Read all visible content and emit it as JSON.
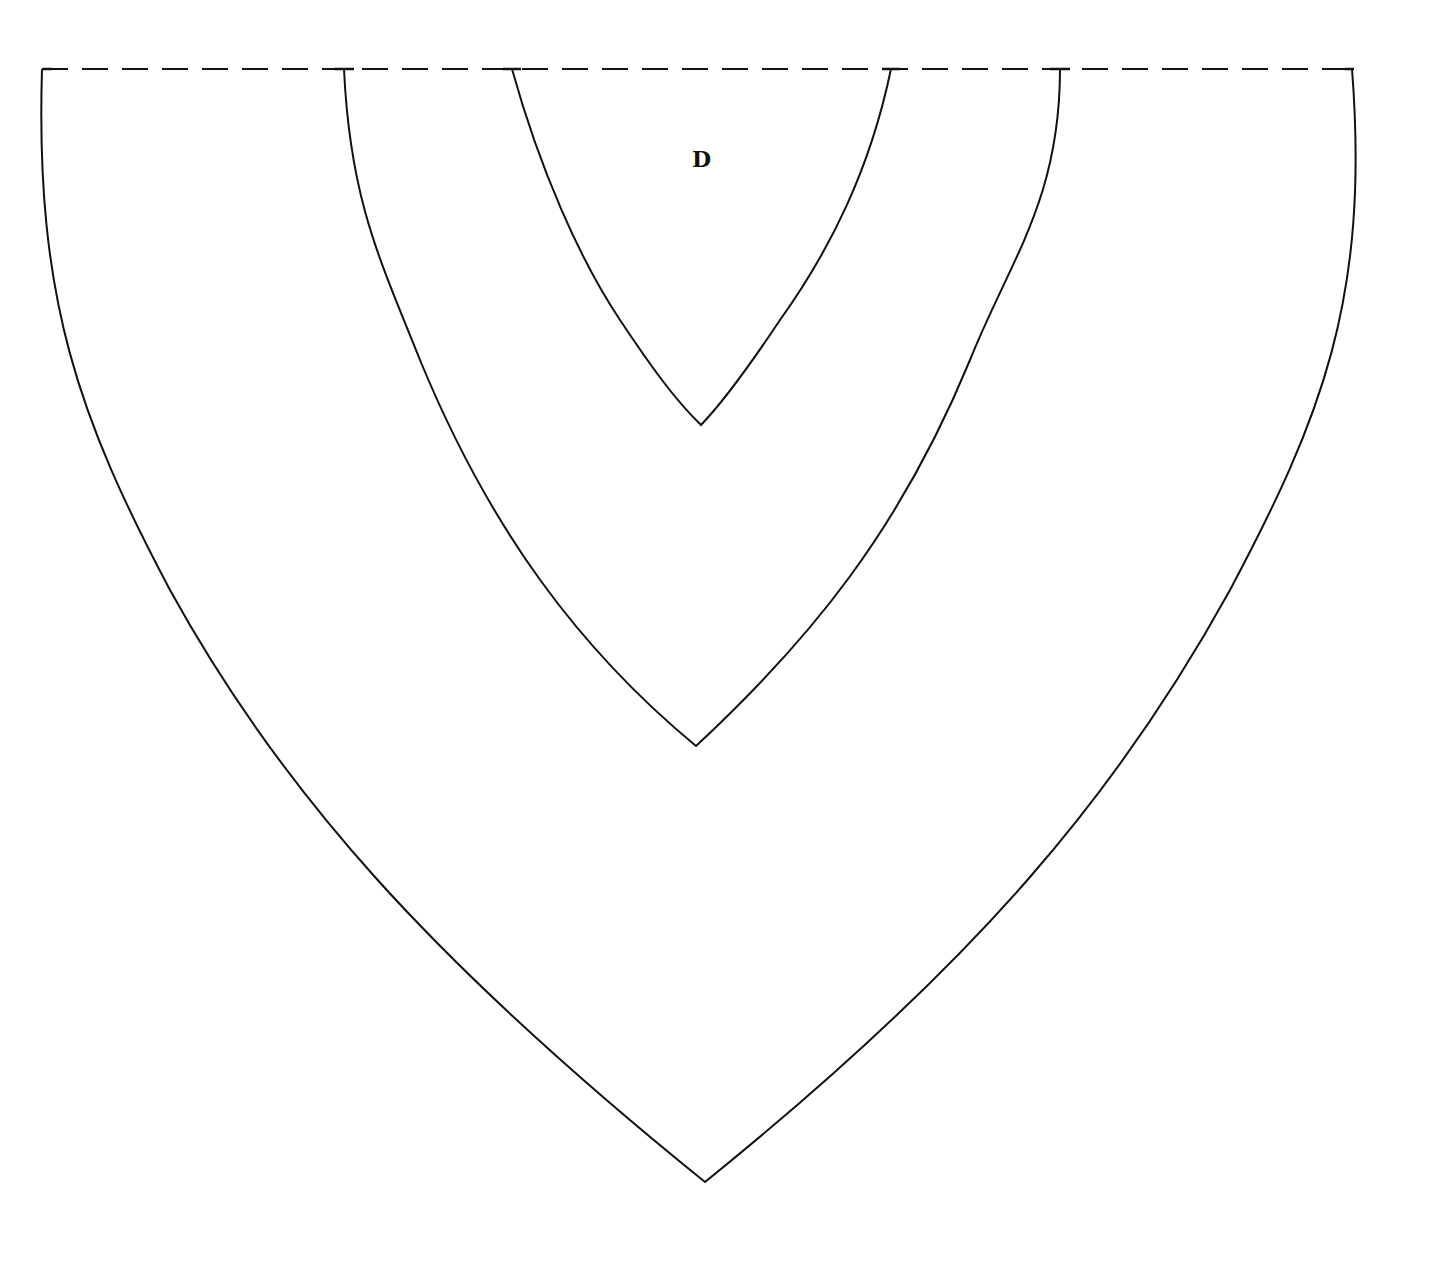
{
  "diagram": {
    "label": "D",
    "stroke_color": "#111111",
    "background": "#ffffff",
    "baseline": {
      "x1": 42,
      "x2": 1354,
      "y": 69,
      "style": "dashed"
    },
    "curves": [
      {
        "name": "outer",
        "left_x": 42,
        "right_x": 1352,
        "apex_x": 705,
        "apex_y": 1182
      },
      {
        "name": "middle",
        "left_x": 344,
        "right_x": 1060,
        "apex_x": 696,
        "apex_y": 746
      },
      {
        "name": "inner",
        "left_x": 512,
        "right_x": 891,
        "apex_x": 701,
        "apex_y": 425
      }
    ]
  }
}
